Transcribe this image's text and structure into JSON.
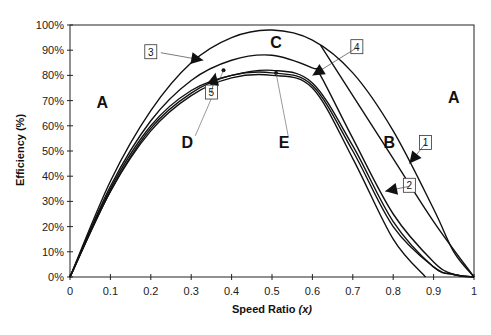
{
  "chart_data": {
    "type": "line",
    "title": "",
    "xlabel": "Speed Ratio (x)",
    "xlabel_main": "Speed Ratio ",
    "xlabel_var": "(x)",
    "ylabel": "Efficiency (%)",
    "xlim": [
      0,
      1
    ],
    "ylim": [
      0,
      100
    ],
    "grid": false,
    "legend": "none",
    "x_ticks": [
      "0",
      "0.1",
      "0.2",
      "0.3",
      "0.4",
      "0.5",
      "0.6",
      "0.7",
      "0.8",
      "0.9",
      "1"
    ],
    "y_ticks": [
      "0%",
      "10%",
      "20%",
      "30%",
      "40%",
      "50%",
      "60%",
      "70%",
      "80%",
      "90%",
      "100%"
    ],
    "series": [
      {
        "name": "1",
        "x": [
          0,
          0.1,
          0.2,
          0.3,
          0.4,
          0.5,
          0.6,
          0.7,
          0.8,
          0.9,
          0.95,
          1.0
        ],
        "values": [
          0,
          38,
          66,
          85,
          95,
          98,
          94,
          81,
          58,
          27,
          10,
          0
        ]
      },
      {
        "name": "2",
        "x": [
          0,
          0.1,
          0.2,
          0.3,
          0.4,
          0.5,
          0.6,
          0.62,
          0.7,
          0.8,
          0.9,
          0.95,
          1.0
        ],
        "values": [
          0,
          36,
          62,
          78,
          86,
          88,
          83,
          80,
          55,
          25,
          6,
          1,
          0
        ]
      },
      {
        "name": "3-4 boundary",
        "x": [
          0.62,
          0.7,
          0.8,
          0.9,
          1.0
        ],
        "values": [
          92,
          72,
          47,
          22,
          0
        ]
      },
      {
        "name": "5a",
        "x": [
          0,
          0.1,
          0.2,
          0.3,
          0.4,
          0.5,
          0.6,
          0.7,
          0.8,
          0.9,
          0.95,
          1.0
        ],
        "values": [
          0,
          35,
          60,
          74,
          80,
          82,
          77,
          52,
          22,
          4,
          1,
          0
        ]
      },
      {
        "name": "5b",
        "x": [
          0,
          0.1,
          0.2,
          0.3,
          0.4,
          0.5,
          0.6,
          0.7,
          0.8,
          0.9,
          0.95,
          1.0
        ],
        "values": [
          0,
          34,
          59,
          73,
          80,
          81,
          76,
          50,
          20,
          4,
          1,
          0
        ]
      },
      {
        "name": "5c",
        "x": [
          0,
          0.1,
          0.2,
          0.3,
          0.4,
          0.5,
          0.6,
          0.7,
          0.8,
          0.88
        ],
        "values": [
          0,
          34,
          58,
          72,
          79,
          80,
          75,
          47,
          15,
          0
        ]
      }
    ],
    "annotations": {
      "regions": [
        {
          "label": "A",
          "x": 0.08,
          "y": 67
        },
        {
          "label": "A",
          "x": 0.95,
          "y": 69
        },
        {
          "label": "B",
          "x": 0.79,
          "y": 51
        },
        {
          "label": "C",
          "x": 0.51,
          "y": 91
        },
        {
          "label": "D",
          "x": 0.29,
          "y": 51
        },
        {
          "label": "E",
          "x": 0.53,
          "y": 51
        }
      ],
      "callouts": [
        {
          "label": "1",
          "x": 0.88,
          "y": 53
        },
        {
          "label": "2",
          "x": 0.84,
          "y": 36
        },
        {
          "label": "3",
          "x": 0.2,
          "y": 89
        },
        {
          "label": "4",
          "x": 0.71,
          "y": 91
        },
        {
          "label": "5",
          "x": 0.35,
          "y": 73
        }
      ],
      "points": [
        {
          "name": "D",
          "x": 0.38,
          "y": 82
        },
        {
          "name": "E",
          "x": 0.51,
          "y": 81
        }
      ]
    }
  }
}
